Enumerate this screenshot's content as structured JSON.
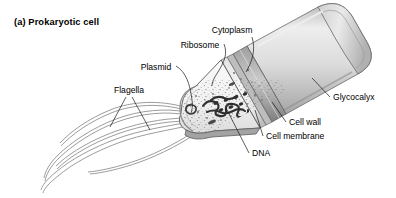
{
  "figure": {
    "title": "(a) Prokaryotic cell",
    "background_color": "#ffffff",
    "ink_color": "#1a1a1a"
  },
  "diagram": {
    "orientation": "long axis running from lower-left to upper-right at about -27 degrees",
    "colors": {
      "capsule_fill": "#d7d7d7",
      "capsule_highlight": "#efefef",
      "capsule_shadow": "#a9a9a9",
      "cell_wall": "#8f8f8f",
      "cytoplasm_fill": "#f2f2f2",
      "stipple": "#9a9a9a",
      "dna_dark": "#3a3a3a",
      "flagella_stroke": "#8a8a8a"
    },
    "labels": [
      {
        "id": "cytoplasm",
        "text": "Cytoplasm",
        "x": 232,
        "y": 33,
        "anchor": "middle"
      },
      {
        "id": "ribosome",
        "text": "Ribosome",
        "x": 200,
        "y": 48,
        "anchor": "middle"
      },
      {
        "id": "plasmid",
        "text": "Plasmid",
        "x": 156,
        "y": 70,
        "anchor": "middle"
      },
      {
        "id": "flagella",
        "text": "Flagella",
        "x": 129,
        "y": 93,
        "anchor": "middle"
      },
      {
        "id": "glycocalyx",
        "text": "Glycocalyx",
        "x": 333,
        "y": 100,
        "anchor": "start"
      },
      {
        "id": "cell-wall",
        "text": "Cell wall",
        "x": 289,
        "y": 125,
        "anchor": "start"
      },
      {
        "id": "cell-membrane",
        "text": "Cell membrane",
        "x": 266,
        "y": 139,
        "anchor": "start"
      },
      {
        "id": "dna",
        "text": "DNA",
        "x": 252,
        "y": 156,
        "anchor": "start"
      }
    ],
    "parts": [
      {
        "id": "glycocalyx",
        "description": "smooth light-gray outer capsule sheathing the intact right half of the cell"
      },
      {
        "id": "cell-wall",
        "description": "mid-gray layer just inside the glycocalyx, visible as a ring at the cut edge"
      },
      {
        "id": "cell-membrane",
        "description": "thin inner layer lining the cytoplasm at the cut edge"
      },
      {
        "id": "cytoplasm",
        "description": "pale stippled interior filling the cut-away left half"
      },
      {
        "id": "ribosome",
        "description": "small dark dots scattered through the cytoplasm"
      },
      {
        "id": "dna",
        "description": "dense dark tangled nucleoid strand in the centre of the cytoplasm"
      },
      {
        "id": "plasmid",
        "description": "small closed loop of DNA near the left rounded end"
      },
      {
        "id": "flagella",
        "description": "four long wavy gray filaments trailing from the left end toward lower-left, crossing one another"
      }
    ]
  }
}
